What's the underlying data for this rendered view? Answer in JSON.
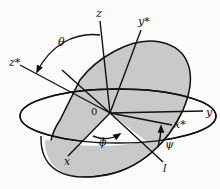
{
  "figure": {
    "colors": {
      "shaded_plane": "#c9c9c9",
      "stroke": "#111111",
      "background": "#fbfbfb"
    },
    "labels": {
      "z": "z",
      "z_star": "z*",
      "y_star": "y*",
      "y": "y",
      "x": "x",
      "x_star": "x*",
      "l": "l",
      "origin": "0",
      "theta": "θ",
      "phi": "ϕ",
      "psi": "ψ"
    }
  }
}
